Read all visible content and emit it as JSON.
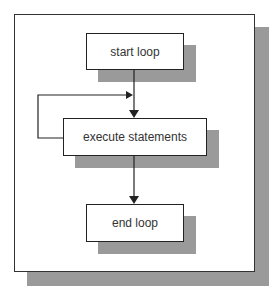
{
  "diagram": {
    "type": "flowchart",
    "nodes": [
      {
        "id": "start",
        "label": "start loop"
      },
      {
        "id": "execute",
        "label": "execute statements"
      },
      {
        "id": "end",
        "label": "end loop"
      }
    ],
    "edges": [
      {
        "from": "start",
        "to": "execute"
      },
      {
        "from": "execute",
        "to": "execute",
        "kind": "loop-back"
      },
      {
        "from": "execute",
        "to": "end"
      }
    ],
    "colors": {
      "shadow": "#9a9a9a",
      "border": "#222222",
      "background": "#ffffff"
    }
  }
}
